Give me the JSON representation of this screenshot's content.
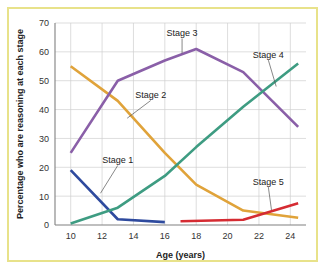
{
  "figure": {
    "border_color": "#e8e28a",
    "background": "#ffffff"
  },
  "chart_data": {
    "type": "line",
    "title": "",
    "xlabel": "Age (years)",
    "ylabel": "Percentage who are reasoning at each stage",
    "xlim": [
      9,
      25
    ],
    "ylim": [
      0,
      70
    ],
    "xticks": [
      10,
      12,
      14,
      16,
      18,
      20,
      22,
      24
    ],
    "yticks": [
      0,
      10,
      20,
      30,
      40,
      50,
      60,
      70
    ],
    "grid": true,
    "legend": "inline-annotations",
    "series": [
      {
        "name": "Stage 1",
        "color": "#2e4a9e",
        "label_x": 13.0,
        "label_y": 21.5,
        "leader_to_x": 11.9,
        "leader_to_y": 11.0,
        "x": [
          10,
          13,
          16
        ],
        "y": [
          19,
          2,
          1
        ]
      },
      {
        "name": "Stage 2",
        "color": "#e0a33a",
        "label_x": 15.1,
        "label_y": 44.0,
        "leader_to_x": 13.6,
        "leader_to_y": 37.0,
        "x": [
          10,
          13,
          16,
          18,
          21,
          24.5
        ],
        "y": [
          55,
          43,
          25,
          14,
          5,
          2.5
        ]
      },
      {
        "name": "Stage 3",
        "color": "#8a5fa8",
        "label_x": 17.1,
        "label_y": 65.5,
        "leader_to_x": 17.1,
        "leader_to_y": 59.5,
        "x": [
          10,
          13,
          16,
          18,
          21,
          24.5
        ],
        "y": [
          25,
          50,
          57,
          61,
          53,
          34
        ]
      },
      {
        "name": "Stage 4",
        "color": "#3e9c82",
        "label_x": 22.6,
        "label_y": 58.0,
        "leader_to_x": 23.1,
        "leader_to_y": 48.0,
        "x": [
          10,
          13,
          16,
          18,
          21,
          24.5
        ],
        "y": [
          0.5,
          6,
          17,
          27,
          41,
          56
        ]
      },
      {
        "name": "Stage 5",
        "color": "#d52b32",
        "label_x": 22.6,
        "label_y": 14.0,
        "leader_to_x": 22.8,
        "leader_to_y": 5.2,
        "x": [
          17,
          21,
          24.5
        ],
        "y": [
          1.3,
          1.8,
          7.5
        ]
      }
    ]
  }
}
